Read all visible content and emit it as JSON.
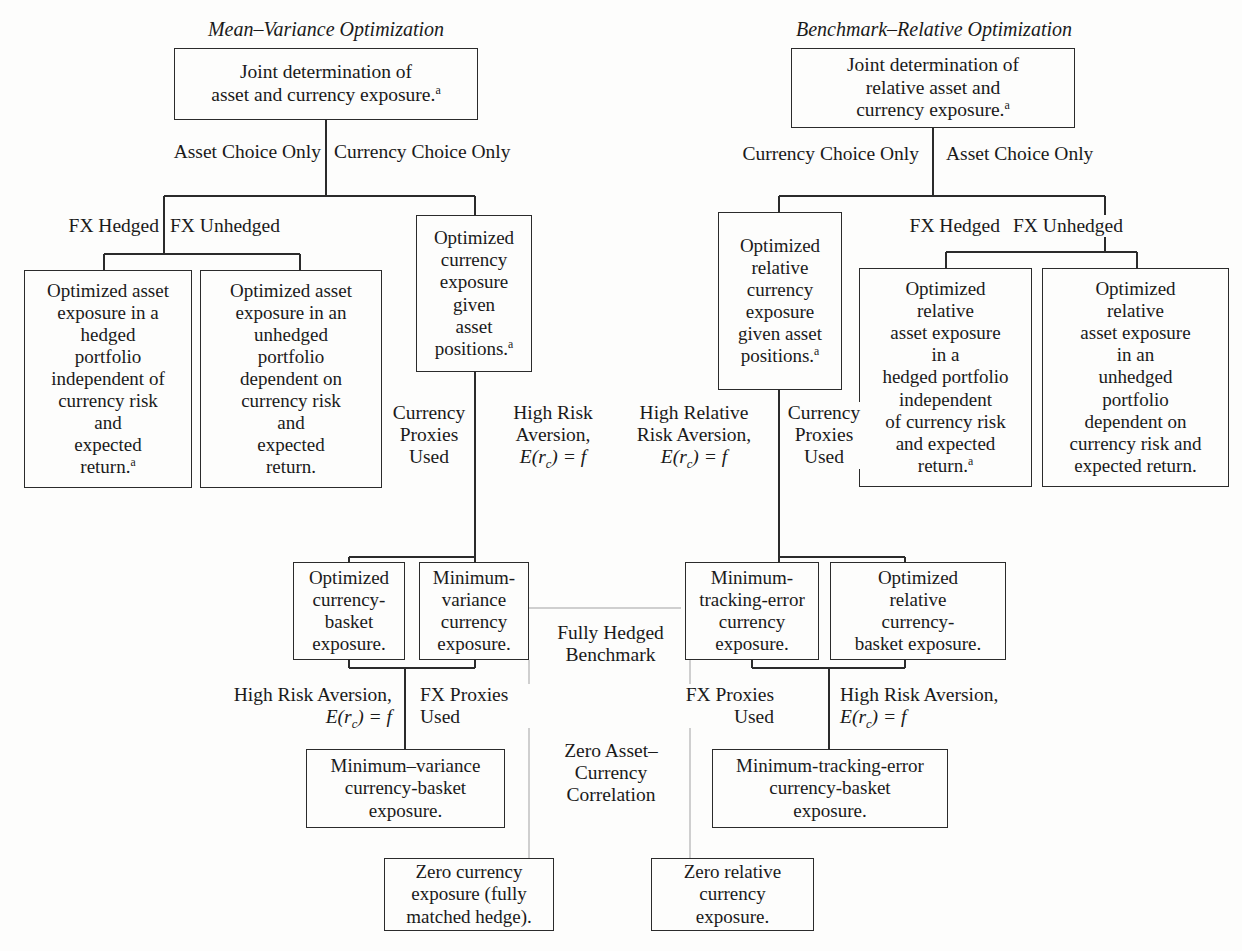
{
  "diagram": {
    "title_left": "Mean–Variance Optimization",
    "title_right": "Benchmark–Relative Optimization",
    "colors": {
      "stroke": "#2b2b2b",
      "faint_stroke": "#cccccc",
      "background": "#fdfdfc",
      "text": "#1a1a1a"
    }
  },
  "nodes": {
    "mv_root": "Joint determination of asset and currency exposure.",
    "mv_hedged": "Optimized asset exposure in a hedged portfolio independent of currency risk and expected return.",
    "mv_unhedged": "Optimized asset exposure in an unhedged portfolio dependent on currency risk and expected return.",
    "mv_currency": "Optimized currency exposure given asset positions.",
    "mv_basket": "Optimized currency-basket exposure.",
    "mv_minvar": "Minimum-variance currency exposure.",
    "mv_minvar_basket": "Minimum–variance currency-basket exposure.",
    "mv_zero": "Zero currency exposure (fully matched hedge).",
    "br_root": "Joint determination of relative asset and currency exposure.",
    "br_currency": "Optimized relative currency exposure given asset positions.",
    "br_hedged": "Optimized relative asset exposure in a hedged portfolio independent of currency risk and expected return.",
    "br_unhedged": "Optimized relative asset exposure in an unhedged portfolio dependent on currency risk and expected return.",
    "br_minte": "Minimum-tracking-error currency exposure.",
    "br_basket": "Optimized relative currency-basket exposure.",
    "br_minte_basket": "Minimum-tracking-error currency-basket exposure.",
    "br_zero": "Zero relative currency exposure."
  },
  "edge_labels": {
    "mv_asset_choice": "Asset Choice Only",
    "mv_currency_choice": "Currency Choice Only",
    "mv_fx_hedged": "FX Hedged",
    "mv_fx_unhedged": "FX Unhedged",
    "mv_currency_proxies": "Currency Proxies Used",
    "mv_high_risk_aversion": "High Risk Aversion,",
    "mv_high_risk_aversion_2": "High Risk Aversion,",
    "mv_fx_proxies": "FX Proxies Used",
    "br_currency_choice": "Currency Choice Only",
    "br_asset_choice": "Asset Choice Only",
    "br_fx_hedged": "FX Hedged",
    "br_fx_unhedged": "FX Unhedged",
    "br_currency_proxies": "Currency Proxies Used",
    "br_high_relative_risk_aversion": "High Relative Risk Aversion,",
    "br_fx_proxies": "FX Proxies Used",
    "br_high_risk_aversion": "High Risk Aversion,",
    "fully_hedged_benchmark": "Fully Hedged Benchmark",
    "zero_asset_currency_correlation": "Zero Asset– Currency Correlation"
  },
  "footnote_marker": "a"
}
